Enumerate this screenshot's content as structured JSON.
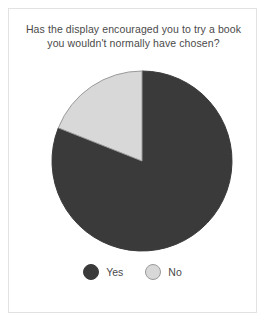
{
  "card": {
    "background_color": "#ffffff",
    "border_color": "#e2e2e2"
  },
  "chart_data": {
    "type": "pie",
    "title": "Has the display encouraged you to try a book you wouldn't normally have chosen?",
    "title_lines": [
      "Has the display encouraged you to try a book",
      "you wouldn't normally have chosen?"
    ],
    "categories": [
      "Yes",
      "No"
    ],
    "values": [
      81,
      19
    ],
    "unit": "%",
    "colors": [
      "#3a3a3a",
      "#d8d8d8"
    ],
    "start_angle_deg": 0,
    "direction": "clockwise",
    "legend_position": "bottom",
    "grid": false,
    "xlabel": "",
    "ylabel": "",
    "slices": [
      {
        "label": "Yes",
        "value": 81,
        "color": "#3a3a3a",
        "stroke": "#3a3a3a",
        "start_deg": 0,
        "end_deg": 291.6,
        "legend_marker": "filled-circle"
      },
      {
        "label": "No",
        "value": 19,
        "color": "#d8d8d8",
        "stroke": "#9a9a9a",
        "start_deg": 291.6,
        "end_deg": 360,
        "legend_marker": "outlined-circle"
      }
    ],
    "geometry": {
      "center_x": 133,
      "center_y": 106,
      "radius": 90
    }
  },
  "legend": {
    "items": [
      {
        "label": "Yes",
        "color": "#3a3a3a",
        "border_color": "#3a3a3a"
      },
      {
        "label": "No",
        "color": "#d8d8d8",
        "border_color": "#9a9a9a"
      }
    ]
  }
}
